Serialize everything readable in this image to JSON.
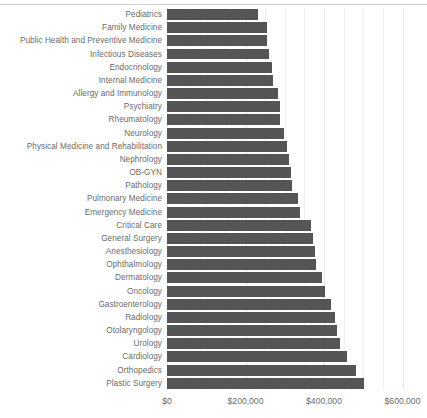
{
  "chart_data": {
    "type": "bar",
    "orientation": "horizontal",
    "title": "",
    "subtitle": "",
    "xlabel": "",
    "ylabel": "",
    "xlim": [
      0,
      600000
    ],
    "xticks": [
      0,
      200000,
      400000,
      600000
    ],
    "xticklabels": [
      "$0",
      "$200,000",
      "$400,000",
      "$600,000"
    ],
    "grid": true,
    "grid_axis": "x",
    "minor_grid": true,
    "legend": false,
    "bar_color": "#555555",
    "background_color": "#ffffff",
    "gridline_color": "#e8e8e8",
    "categories": [
      "Pediatrics",
      "Family Medicine",
      "Public Health and Preventive Medicine",
      "Infectious Diseases",
      "Endocrinology",
      "Internal Medicine",
      "Allergy and Immunology",
      "Psychiatry",
      "Rheumatology",
      "Neurology",
      "Physical Medicine and Rehabilitation",
      "Nephrology",
      "OB-GYN",
      "Pathology",
      "Pulmonary Medicine",
      "Emergency Medicine",
      "Critical Care",
      "General Surgery",
      "Anesthesiology",
      "Ophthalmology",
      "Dermatology",
      "Oncology",
      "Gastroenterology",
      "Radiology",
      "Otolaryngology",
      "Urology",
      "Cardiology",
      "Orthopedics",
      "Plastic Surgery"
    ],
    "values": [
      232000,
      255000,
      255000,
      260000,
      267000,
      270000,
      282000,
      287000,
      289000,
      298000,
      306000,
      312000,
      317000,
      318000,
      333000,
      339000,
      366000,
      373000,
      378000,
      379000,
      394000,
      403000,
      419000,
      427000,
      432000,
      442000,
      459000,
      482000,
      501000
    ]
  }
}
